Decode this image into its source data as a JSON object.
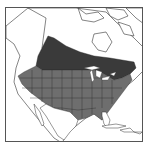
{
  "map": {
    "type": "range-map",
    "region": "North America",
    "colors": {
      "background": "#ffffff",
      "land_outline": "#333333",
      "breeding_range": "#3a3a3a",
      "year_round_range": "#6e6e6e",
      "water": "#ffffff",
      "frame": "#555555"
    },
    "legend": []
  }
}
